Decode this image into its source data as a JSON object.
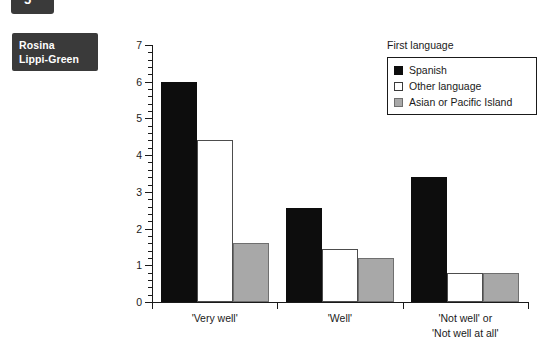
{
  "page": {
    "tab_marker_glyph": "5",
    "author_line1": "Rosina",
    "author_line2": "Lippi-Green"
  },
  "legend": {
    "title": "First language",
    "items": [
      {
        "label": "Spanish",
        "color": "#0d0d0d",
        "key": "spanish"
      },
      {
        "label": "Other language",
        "color": "#ffffff",
        "key": "other"
      },
      {
        "label": "Asian or Pacific Island",
        "color": "#a8a8a8",
        "key": "asian"
      }
    ]
  },
  "chart_data": {
    "type": "bar",
    "title": "",
    "xlabel": "",
    "ylabel": "",
    "ylim": [
      0,
      7
    ],
    "yticks": [
      0,
      1,
      2,
      3,
      4,
      5,
      6,
      7
    ],
    "ytick_labels": [
      "0",
      "1",
      "2",
      "3",
      "4",
      "5",
      "6",
      "7"
    ],
    "grid": false,
    "legend_position": "top-right",
    "categories": [
      "'Very well'",
      "'Well'",
      "'Not well' or\n'Not well at all'"
    ],
    "category_lines": [
      [
        "'Very well'"
      ],
      [
        "'Well'"
      ],
      [
        "'Not well' or",
        "'Not well at all'"
      ]
    ],
    "series": [
      {
        "name": "Spanish",
        "color": "#0d0d0d",
        "values": [
          6.0,
          2.56,
          3.4
        ]
      },
      {
        "name": "Other language",
        "color": "#ffffff",
        "values": [
          4.4,
          1.45,
          0.8
        ]
      },
      {
        "name": "Asian or Pacific Island",
        "color": "#a8a8a8",
        "values": [
          1.6,
          1.2,
          0.8
        ]
      }
    ]
  }
}
